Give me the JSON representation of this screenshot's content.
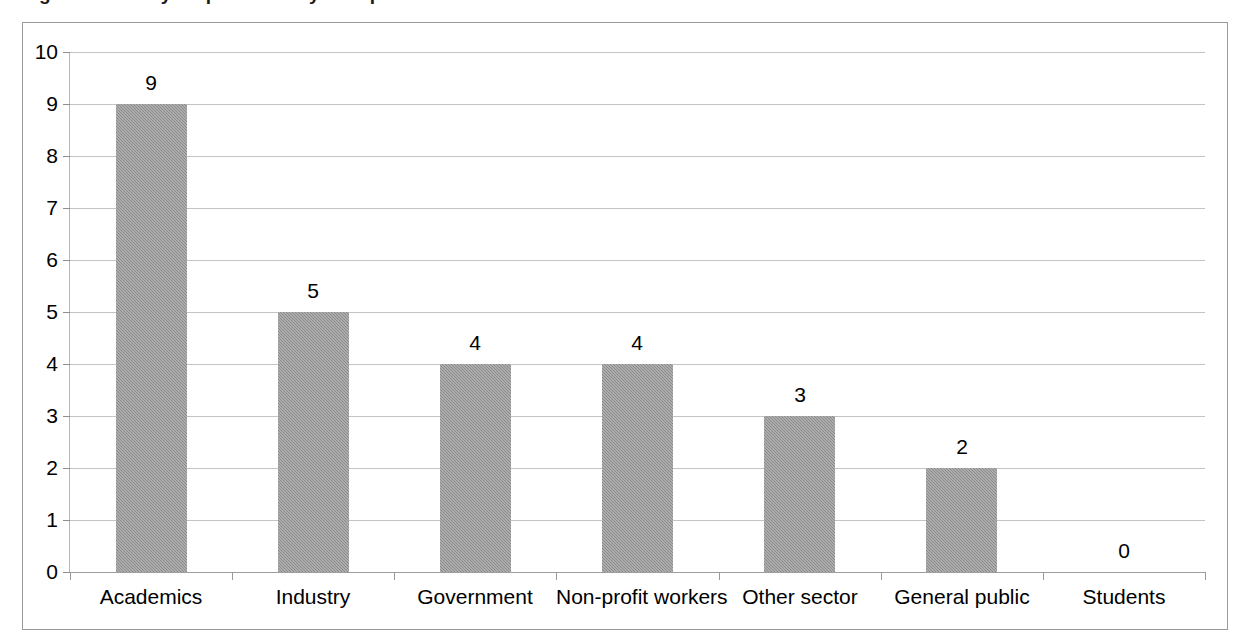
{
  "chart_data": {
    "type": "bar",
    "title": "Figure 5. Survey respondents by occupation",
    "categories": [
      "Academics",
      "Industry",
      "Government",
      "Non-profit workers",
      "Other sector",
      "General public",
      "Students"
    ],
    "values": [
      9,
      5,
      4,
      4,
      3,
      2,
      0
    ],
    "value_labels": [
      "9",
      "5",
      "4",
      "4",
      "3",
      "2",
      "0"
    ],
    "xlabel": "",
    "ylabel": "",
    "ylim": [
      0,
      10
    ],
    "ytick_labels": [
      "0",
      "1",
      "2",
      "3",
      "4",
      "5",
      "6",
      "7",
      "8",
      "9",
      "10"
    ],
    "ytick_values": [
      0,
      1,
      2,
      3,
      4,
      5,
      6,
      7,
      8,
      9,
      10
    ],
    "grid": true,
    "legend": false,
    "legend_position": "none",
    "bar_color": "#8a8a8a",
    "gridline_color": "#c4c4c4",
    "axis_color": "#9a9a9a",
    "plot_background": "#ffffff"
  }
}
